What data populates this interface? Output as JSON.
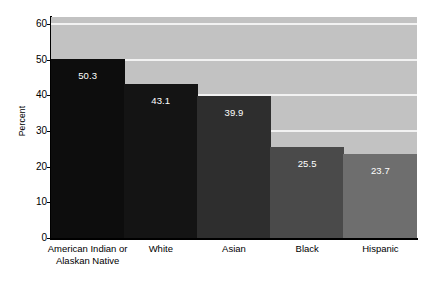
{
  "chart_data": {
    "type": "bar",
    "title": "",
    "subtitle": "",
    "xlabel": "",
    "ylabel": "Percent",
    "ylim": [
      0,
      62
    ],
    "yticks": [
      0,
      10,
      20,
      30,
      40,
      50,
      60
    ],
    "ytick_labels": [
      "0",
      "10",
      "20",
      "30",
      "40",
      "50",
      "60"
    ],
    "grid": true,
    "gridlines_at": [
      10,
      20,
      30,
      40,
      50,
      60
    ],
    "legend": null,
    "categories": [
      "American Indian or Alaskan Native",
      "White",
      "Asian",
      "Black",
      "Hispanic"
    ],
    "category_lines": [
      [
        "American Indian or",
        "Alaskan Native"
      ],
      [
        "White"
      ],
      [
        "Asian"
      ],
      [
        "Black"
      ],
      [
        "Hispanic"
      ]
    ],
    "values": [
      50.3,
      43.1,
      39.9,
      25.5,
      23.7
    ],
    "value_labels": [
      "50.3",
      "43.1",
      "39.9",
      "25.5",
      "23.7"
    ],
    "bar_colors": [
      "#0d0d0d",
      "#141414",
      "#2e2e2e",
      "#4a4a4a",
      "#6e6e6e"
    ],
    "plot_background": "#c2c2c2",
    "gridline_color": "#f2f2f2",
    "axis_color": "#000000",
    "value_label_color": "#ffffff",
    "figure_background": "#ffffff"
  }
}
